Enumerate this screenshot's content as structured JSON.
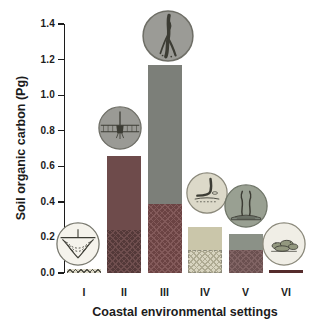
{
  "chart_data": {
    "type": "bar",
    "stacked": true,
    "title": "",
    "xlabel": "Coastal environmental settings",
    "ylabel": "Soil organic carbon (Pg)",
    "categories": [
      "I",
      "II",
      "III",
      "IV",
      "V",
      "VI"
    ],
    "series": [
      {
        "name": "lower hatched segment",
        "values": [
          0.02,
          0.24,
          0.39,
          0.13,
          0.13,
          0.01
        ]
      },
      {
        "name": "upper solid segment",
        "values": [
          0.0,
          0.42,
          0.78,
          0.13,
          0.09,
          0.0
        ]
      }
    ],
    "totals": [
      0.02,
      0.66,
      1.17,
      0.26,
      0.22,
      0.01
    ],
    "ylim": [
      0,
      1.4
    ],
    "yticks": [
      "0.0",
      "0.2",
      "0.4",
      "0.6",
      "0.8",
      "1.0",
      "1.2",
      "1.4"
    ],
    "grid": false,
    "legend_position": "none"
  },
  "bars": [
    {
      "category": "I",
      "total": 0.02,
      "hatched": 0.02,
      "solid": 0.0,
      "pattern": "fine-hatch",
      "colors": {
        "hatch_base": "#dcd8c6",
        "hatch_line": "#55544a",
        "border": "#4a4a40"
      },
      "icon": {
        "name": "fjord-cross-section-icon",
        "bg": "#f5f3ec",
        "border": "#78786e"
      }
    },
    {
      "category": "II",
      "total": 0.66,
      "hatched": 0.24,
      "solid": 0.42,
      "pattern": "cross-hatch",
      "colors": {
        "solid": "#6e4b4b",
        "hatch_base": "#543939",
        "hatch_line": "#6f4e4e"
      },
      "icon": {
        "name": "estuary-icon",
        "bg": "#9a9a95",
        "border": "#6e6e66"
      }
    },
    {
      "category": "III",
      "total": 1.17,
      "hatched": 0.39,
      "solid": 0.78,
      "pattern": "cross-hatch",
      "colors": {
        "solid": "#7c7f79",
        "hatch_base": "#6b4343",
        "hatch_line": "#835a5a"
      },
      "icon": {
        "name": "river-delta-icon",
        "bg": "#9b9b96",
        "border": "#6e6e66"
      }
    },
    {
      "category": "IV",
      "total": 0.26,
      "hatched": 0.13,
      "solid": 0.13,
      "pattern": "cross-hatch-light",
      "colors": {
        "solid": "#cac6aa",
        "hatch_base": "#d8d4c0",
        "hatch_line": "#aeaa92",
        "hatch_border": "#8e8c7c"
      },
      "icon": {
        "name": "lagoon-icon",
        "bg": "#dcd9c9",
        "border": "#8a887a"
      }
    },
    {
      "category": "V",
      "total": 0.22,
      "hatched": 0.13,
      "solid": 0.09,
      "pattern": "cross-hatch",
      "colors": {
        "solid": "#8b9187",
        "hatch_base": "#6b5050",
        "hatch_line": "#806363"
      },
      "icon": {
        "name": "seagrass-icon",
        "bg": "#99a092",
        "border": "#6f7568"
      }
    },
    {
      "category": "VI",
      "total": 0.01,
      "hatched": 0.01,
      "solid": 0.0,
      "pattern": "solid-line",
      "colors": {
        "hatch_base": "#552c2c"
      },
      "icon": {
        "name": "reef-rocks-icon",
        "bg": "#f0eee6",
        "border": "#8a887a"
      }
    }
  ],
  "axes": {
    "ink_color": "#1c1c1c"
  }
}
